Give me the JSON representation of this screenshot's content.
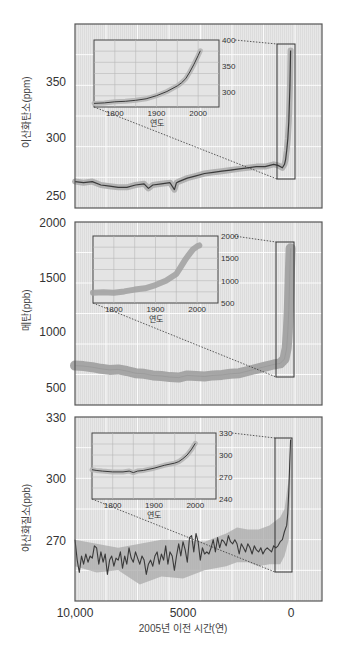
{
  "figure": {
    "x_axis": {
      "title": "2005년 이전 시간(연)",
      "ticks": [
        "10,000",
        "5000",
        "0"
      ],
      "tick_values": [
        10000,
        5000,
        0
      ],
      "range": [
        10000,
        -1435
      ]
    },
    "inset_x_title": "연도"
  },
  "colors": {
    "panel_bg": "#e6e6e6",
    "grid": "#ffffff",
    "frame": "#555555",
    "line": "#3a3a3a",
    "band": "#a9a9a9",
    "band_methane": "#9f9f9f"
  },
  "chart_data": [
    {
      "type": "line",
      "title": "",
      "ylabel": "이산화탄소(ppm)",
      "xlabel": "2005년 이전 시간(연)",
      "ylim": [
        240,
        400
      ],
      "yticks": [
        250,
        300,
        350
      ],
      "ytick_labels": [
        "250",
        "300",
        "350"
      ],
      "grid": true,
      "x": [
        10000,
        9600,
        9200,
        8800,
        8400,
        8000,
        7600,
        7200,
        6800,
        6600,
        6400,
        6000,
        5600,
        5400,
        5300,
        5200,
        4800,
        4400,
        4000,
        3600,
        3200,
        2800,
        2400,
        2000,
        1600,
        1200,
        800,
        600,
        400,
        300,
        250,
        200,
        150,
        100,
        50,
        20
      ],
      "series": [
        {
          "name": "CO2",
          "values": [
            263,
            262,
            263,
            260,
            259,
            258,
            258,
            260,
            261,
            257,
            260,
            261,
            262,
            256,
            262,
            263,
            266,
            268,
            270,
            271,
            272,
            273,
            274,
            275,
            276,
            276,
            278,
            277,
            275,
            278,
            282,
            290,
            300,
            315,
            345,
            377
          ]
        }
      ],
      "highlight_box": {
        "x_range": [
          650,
          -180
        ],
        "y_range": [
          262,
          382
        ]
      },
      "inset": {
        "xlabel": "연도",
        "xticks": [
          "1800",
          "1900",
          "2000"
        ],
        "ytick_labels": [
          "300",
          "350",
          "400"
        ],
        "ylim": [
          270,
          400
        ],
        "x": [
          1750,
          1775,
          1800,
          1825,
          1850,
          1875,
          1900,
          1925,
          1950,
          1960,
          1970,
          1980,
          1990,
          2000,
          2005
        ],
        "values": [
          277,
          278,
          280,
          281,
          283,
          286,
          292,
          300,
          311,
          317,
          325,
          338,
          353,
          370,
          379
        ]
      }
    },
    {
      "type": "line",
      "title": "",
      "ylabel": "메탄(ppb)",
      "xlabel": "2005년 이전 시간(연)",
      "ylim": [
        330,
        2000
      ],
      "yticks": [
        500,
        1000,
        1500,
        2000
      ],
      "ytick_labels": [
        "500",
        "1000",
        "1500",
        "2000"
      ],
      "grid": true,
      "x": [
        10000,
        9600,
        9200,
        8800,
        8400,
        8000,
        7600,
        7200,
        6800,
        6400,
        6000,
        5600,
        5200,
        4800,
        4400,
        4000,
        3600,
        3200,
        2800,
        2400,
        2000,
        1600,
        1200,
        800,
        500,
        300,
        200,
        150,
        100,
        50,
        20
      ],
      "series": [
        {
          "name": "CH4",
          "values": [
            690,
            685,
            675,
            660,
            650,
            655,
            640,
            620,
            615,
            600,
            595,
            585,
            580,
            600,
            595,
            590,
            600,
            605,
            615,
            620,
            640,
            660,
            680,
            700,
            710,
            750,
            850,
            1000,
            1200,
            1550,
            1760
          ]
        }
      ],
      "band_halfwidth": 45,
      "highlight_box": {
        "x_range": [
          700,
          -130
        ],
        "y_range": [
          560,
          1820
        ]
      },
      "inset": {
        "xlabel": "연도",
        "xticks": [
          "1800",
          "1900",
          "2000"
        ],
        "ytick_labels": [
          "500",
          "1000",
          "1500",
          "2000"
        ],
        "ylim": [
          500,
          2000
        ],
        "x": [
          1750,
          1775,
          1800,
          1825,
          1850,
          1875,
          1900,
          1925,
          1950,
          1960,
          1970,
          1980,
          1990,
          2000,
          2005
        ],
        "values": [
          730,
          740,
          730,
          760,
          800,
          830,
          900,
          1000,
          1150,
          1300,
          1450,
          1580,
          1700,
          1770,
          1790
        ]
      }
    },
    {
      "type": "line",
      "title": "",
      "ylabel": "아산화질소(ppb)",
      "xlabel": "2005년 이전 시간(연)",
      "ylim": [
        240,
        330
      ],
      "yticks": [
        270,
        300,
        330
      ],
      "ytick_labels": [
        "270",
        "300",
        "330"
      ],
      "grid": true,
      "x": [
        10000,
        9900,
        9800,
        9700,
        9600,
        9500,
        9400,
        9300,
        9200,
        9100,
        9000,
        8900,
        8800,
        8700,
        8600,
        8500,
        8400,
        8300,
        8200,
        8100,
        8000,
        7900,
        7800,
        7700,
        7600,
        7500,
        7400,
        7300,
        7200,
        7100,
        7000,
        6900,
        6800,
        6700,
        6600,
        6500,
        6400,
        6300,
        6200,
        6100,
        6000,
        5900,
        5800,
        5700,
        5600,
        5500,
        5400,
        5300,
        5200,
        5100,
        5000,
        4900,
        4800,
        4700,
        4600,
        4500,
        4400,
        4300,
        4200,
        4100,
        4000,
        3900,
        3800,
        3700,
        3600,
        3500,
        3400,
        3300,
        3200,
        3100,
        3000,
        2900,
        2800,
        2700,
        2600,
        2500,
        2400,
        2300,
        2200,
        2100,
        2000,
        1900,
        1800,
        1700,
        1600,
        1500,
        1400,
        1300,
        1200,
        1100,
        1000,
        900,
        800,
        700,
        600,
        500,
        400,
        300,
        200,
        150,
        100,
        60,
        20
      ],
      "series": [
        {
          "name": "N2O",
          "values": [
            270,
            260,
            254,
            262,
            258,
            263,
            259,
            262,
            261,
            267,
            266,
            258,
            264,
            259,
            263,
            253,
            260,
            262,
            257,
            261,
            260,
            264,
            256,
            262,
            258,
            266,
            261,
            259,
            264,
            261,
            258,
            262,
            260,
            253,
            258,
            260,
            257,
            262,
            264,
            258,
            263,
            260,
            267,
            258,
            264,
            262,
            255,
            262,
            268,
            262,
            269,
            265,
            259,
            271,
            272,
            264,
            273,
            269,
            260,
            266,
            263,
            264,
            263,
            266,
            270,
            264,
            271,
            266,
            270,
            269,
            267,
            272,
            269,
            268,
            270,
            268,
            263,
            268,
            266,
            264,
            268,
            266,
            263,
            267,
            265,
            264,
            266,
            263,
            265,
            266,
            265,
            264,
            267,
            266,
            267,
            269,
            270,
            274,
            277,
            283,
            294,
            307,
            319
          ]
        }
      ],
      "uncertainty_band": {
        "x": [
          10000,
          9000,
          8000,
          7000,
          6000,
          5000,
          4000,
          3000,
          2500,
          2000,
          1500,
          1000,
          500,
          300,
          100,
          20
        ],
        "upper": [
          270,
          268,
          266,
          268,
          270,
          270,
          269,
          273,
          276,
          275,
          275,
          277,
          281,
          285,
          300,
          320
        ],
        "lower": [
          257,
          254,
          255,
          248,
          252,
          251,
          255,
          257,
          259,
          259,
          257,
          258,
          258,
          262,
          270,
          300
        ]
      },
      "highlight_box": {
        "x_range": [
          700,
          -110
        ],
        "y_range": [
          255,
          320
        ]
      },
      "inset": {
        "xlabel": "연도",
        "xticks": [
          "1800",
          "1900",
          "2000"
        ],
        "ytick_labels": [
          "240",
          "270",
          "300",
          "330"
        ],
        "ylim": [
          240,
          330
        ],
        "x": [
          1750,
          1760,
          1775,
          1800,
          1825,
          1840,
          1850,
          1860,
          1875,
          1900,
          1925,
          1950,
          1960,
          1970,
          1980,
          1990,
          2000
        ],
        "values": [
          280,
          279,
          278,
          277,
          277,
          278,
          276,
          278,
          279,
          282,
          286,
          289,
          291,
          295,
          300,
          307,
          316
        ]
      }
    }
  ]
}
